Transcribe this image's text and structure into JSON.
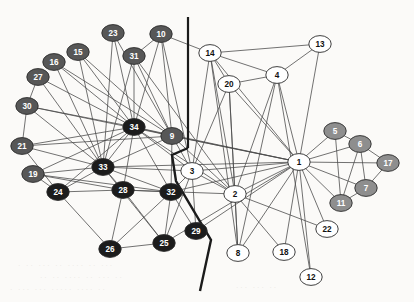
{
  "figure": {
    "name": "social-network-graph",
    "background_color": "#fbfaf8",
    "width": 414,
    "height": 302
  },
  "chart_data": {
    "type": "scatter",
    "title": "",
    "xlabel": "",
    "ylabel": "",
    "layout": "node-link network diagram",
    "grid": false,
    "legend_position": "none",
    "node_fill_classes": {
      "white": "#ffffff",
      "gray": "#8e8e8e",
      "dark_gray": "#575757",
      "black": "#1c1c1c"
    },
    "nodes": [
      {
        "id": "1",
        "label": "1",
        "x": 299,
        "y": 162,
        "group": "white"
      },
      {
        "id": "2",
        "label": "2",
        "x": 235,
        "y": 194,
        "group": "white"
      },
      {
        "id": "3",
        "label": "3",
        "x": 192,
        "y": 171,
        "group": "white"
      },
      {
        "id": "4",
        "label": "4",
        "x": 277,
        "y": 75,
        "group": "white"
      },
      {
        "id": "5",
        "label": "5",
        "x": 335,
        "y": 131,
        "group": "gray"
      },
      {
        "id": "6",
        "label": "6",
        "x": 360,
        "y": 144,
        "group": "gray"
      },
      {
        "id": "7",
        "label": "7",
        "x": 366,
        "y": 188,
        "group": "gray"
      },
      {
        "id": "8",
        "label": "8",
        "x": 238,
        "y": 253,
        "group": "white"
      },
      {
        "id": "9",
        "label": "9",
        "x": 172,
        "y": 136,
        "group": "dark_gray"
      },
      {
        "id": "10",
        "label": "10",
        "x": 161,
        "y": 34,
        "group": "dark_gray"
      },
      {
        "id": "11",
        "label": "11",
        "x": 341,
        "y": 203,
        "group": "gray"
      },
      {
        "id": "12",
        "label": "12",
        "x": 311,
        "y": 277,
        "group": "white"
      },
      {
        "id": "13",
        "label": "13",
        "x": 320,
        "y": 44,
        "group": "white"
      },
      {
        "id": "14",
        "label": "14",
        "x": 210,
        "y": 53,
        "group": "white"
      },
      {
        "id": "15",
        "label": "15",
        "x": 78,
        "y": 52,
        "group": "dark_gray"
      },
      {
        "id": "16",
        "label": "16",
        "x": 54,
        "y": 62,
        "group": "dark_gray"
      },
      {
        "id": "17",
        "label": "17",
        "x": 388,
        "y": 163,
        "group": "gray"
      },
      {
        "id": "18",
        "label": "18",
        "x": 284,
        "y": 252,
        "group": "white"
      },
      {
        "id": "19",
        "label": "19",
        "x": 33,
        "y": 174,
        "group": "dark_gray"
      },
      {
        "id": "20",
        "label": "20",
        "x": 229,
        "y": 84,
        "group": "white"
      },
      {
        "id": "21",
        "label": "21",
        "x": 22,
        "y": 146,
        "group": "dark_gray"
      },
      {
        "id": "22",
        "label": "22",
        "x": 327,
        "y": 229,
        "group": "white"
      },
      {
        "id": "23",
        "label": "23",
        "x": 113,
        "y": 33,
        "group": "dark_gray"
      },
      {
        "id": "24",
        "label": "24",
        "x": 58,
        "y": 192,
        "group": "black"
      },
      {
        "id": "25",
        "label": "25",
        "x": 164,
        "y": 243,
        "group": "black"
      },
      {
        "id": "26",
        "label": "26",
        "x": 110,
        "y": 249,
        "group": "black"
      },
      {
        "id": "27",
        "label": "27",
        "x": 38,
        "y": 77,
        "group": "dark_gray"
      },
      {
        "id": "28",
        "label": "28",
        "x": 123,
        "y": 190,
        "group": "black"
      },
      {
        "id": "29",
        "label": "29",
        "x": 196,
        "y": 231,
        "group": "black"
      },
      {
        "id": "30",
        "label": "30",
        "x": 27,
        "y": 106,
        "group": "dark_gray"
      },
      {
        "id": "31",
        "label": "31",
        "x": 134,
        "y": 56,
        "group": "dark_gray"
      },
      {
        "id": "32",
        "label": "32",
        "x": 171,
        "y": 192,
        "group": "black"
      },
      {
        "id": "33",
        "label": "33",
        "x": 103,
        "y": 167,
        "group": "black"
      },
      {
        "id": "34",
        "label": "34",
        "x": 134,
        "y": 127,
        "group": "black"
      }
    ],
    "edges": [
      [
        "1",
        "2"
      ],
      [
        "1",
        "3"
      ],
      [
        "1",
        "4"
      ],
      [
        "1",
        "5"
      ],
      [
        "1",
        "6"
      ],
      [
        "1",
        "7"
      ],
      [
        "1",
        "8"
      ],
      [
        "1",
        "9"
      ],
      [
        "1",
        "11"
      ],
      [
        "1",
        "12"
      ],
      [
        "1",
        "13"
      ],
      [
        "1",
        "14"
      ],
      [
        "1",
        "17"
      ],
      [
        "1",
        "18"
      ],
      [
        "1",
        "20"
      ],
      [
        "1",
        "22"
      ],
      [
        "1",
        "30"
      ],
      [
        "1",
        "32"
      ],
      [
        "1",
        "33"
      ],
      [
        "1",
        "34"
      ],
      [
        "1",
        "29"
      ],
      [
        "1",
        "25"
      ],
      [
        "2",
        "3"
      ],
      [
        "2",
        "4"
      ],
      [
        "2",
        "8"
      ],
      [
        "2",
        "14"
      ],
      [
        "2",
        "18"
      ],
      [
        "2",
        "20"
      ],
      [
        "2",
        "22"
      ],
      [
        "2",
        "31"
      ],
      [
        "2",
        "9"
      ],
      [
        "2",
        "34"
      ],
      [
        "2",
        "28"
      ],
      [
        "3",
        "9"
      ],
      [
        "3",
        "14"
      ],
      [
        "3",
        "20"
      ],
      [
        "3",
        "32"
      ],
      [
        "3",
        "33"
      ],
      [
        "3",
        "34"
      ],
      [
        "3",
        "29"
      ],
      [
        "3",
        "25"
      ],
      [
        "3",
        "2"
      ],
      [
        "3",
        "10"
      ],
      [
        "4",
        "8"
      ],
      [
        "4",
        "13"
      ],
      [
        "4",
        "14"
      ],
      [
        "4",
        "12"
      ],
      [
        "4",
        "20"
      ],
      [
        "4",
        "2"
      ],
      [
        "5",
        "6"
      ],
      [
        "5",
        "11"
      ],
      [
        "5",
        "1"
      ],
      [
        "6",
        "7"
      ],
      [
        "6",
        "11"
      ],
      [
        "6",
        "17"
      ],
      [
        "6",
        "1"
      ],
      [
        "7",
        "17"
      ],
      [
        "7",
        "11"
      ],
      [
        "8",
        "14"
      ],
      [
        "8",
        "20"
      ],
      [
        "8",
        "2"
      ],
      [
        "9",
        "10"
      ],
      [
        "9",
        "31"
      ],
      [
        "9",
        "33"
      ],
      [
        "9",
        "34"
      ],
      [
        "9",
        "32"
      ],
      [
        "9",
        "23"
      ],
      [
        "9",
        "16"
      ],
      [
        "9",
        "15"
      ],
      [
        "10",
        "34"
      ],
      [
        "10",
        "31"
      ],
      [
        "10",
        "3"
      ],
      [
        "10",
        "14"
      ],
      [
        "13",
        "14"
      ],
      [
        "13",
        "4"
      ],
      [
        "14",
        "20"
      ],
      [
        "14",
        "2"
      ],
      [
        "14",
        "8"
      ],
      [
        "14",
        "3"
      ],
      [
        "15",
        "34"
      ],
      [
        "15",
        "33"
      ],
      [
        "15",
        "9"
      ],
      [
        "16",
        "34"
      ],
      [
        "16",
        "33"
      ],
      [
        "16",
        "9"
      ],
      [
        "19",
        "34"
      ],
      [
        "19",
        "33"
      ],
      [
        "19",
        "24"
      ],
      [
        "19",
        "28"
      ],
      [
        "19",
        "32"
      ],
      [
        "21",
        "34"
      ],
      [
        "21",
        "33"
      ],
      [
        "21",
        "24"
      ],
      [
        "21",
        "9"
      ],
      [
        "23",
        "34"
      ],
      [
        "23",
        "33"
      ],
      [
        "23",
        "9"
      ],
      [
        "24",
        "26"
      ],
      [
        "24",
        "28"
      ],
      [
        "24",
        "33"
      ],
      [
        "24",
        "34"
      ],
      [
        "25",
        "26"
      ],
      [
        "25",
        "28"
      ],
      [
        "25",
        "32"
      ],
      [
        "25",
        "33"
      ],
      [
        "26",
        "28"
      ],
      [
        "26",
        "32"
      ],
      [
        "27",
        "34"
      ],
      [
        "27",
        "33"
      ],
      [
        "27",
        "30"
      ],
      [
        "28",
        "32"
      ],
      [
        "28",
        "33"
      ],
      [
        "28",
        "34"
      ],
      [
        "29",
        "32"
      ],
      [
        "29",
        "3"
      ],
      [
        "30",
        "34"
      ],
      [
        "30",
        "33"
      ],
      [
        "30",
        "21"
      ],
      [
        "31",
        "34"
      ],
      [
        "31",
        "33"
      ],
      [
        "32",
        "33"
      ],
      [
        "32",
        "34"
      ],
      [
        "32",
        "3"
      ],
      [
        "33",
        "34"
      ]
    ],
    "annotations": [
      {
        "name": "vertical-divider",
        "type": "line",
        "points": [
          [
            188,
            17
          ],
          [
            188,
            148
          ]
        ]
      },
      {
        "name": "cluster-boundary-polyline",
        "type": "polyline",
        "points": [
          [
            188,
            148
          ],
          [
            172,
            155
          ],
          [
            176,
            181
          ],
          [
            211,
            240
          ],
          [
            200,
            291
          ]
        ]
      }
    ]
  }
}
